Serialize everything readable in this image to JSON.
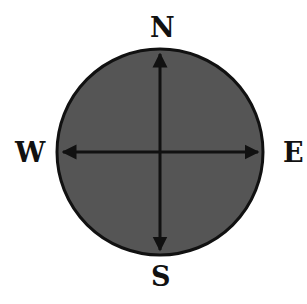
{
  "diagram": {
    "labels": {
      "north": "N",
      "south": "S",
      "east": "E",
      "west": "W"
    },
    "colors": {
      "disc_fill": "#555555",
      "outline": "#111111",
      "text": "#111111",
      "background": "#ffffff"
    }
  }
}
